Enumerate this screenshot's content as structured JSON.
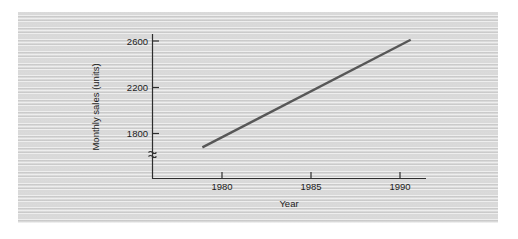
{
  "chart_data": {
    "type": "line",
    "title": "",
    "xlabel": "Year",
    "ylabel": "Monthly sales (units)",
    "xlim": [
      1976.8,
      1992.2
    ],
    "ylim": [
      1590,
      2690
    ],
    "grid": false,
    "legend": null,
    "y_axis_break": true,
    "y_axis_break_symbol": "≈",
    "xticks": [
      1980,
      1985,
      1990
    ],
    "xtick_labels": [
      "1980",
      "1985",
      "1990"
    ],
    "yticks": [
      1800,
      2200,
      2600
    ],
    "ytick_labels": [
      "1800",
      "2200",
      "2600"
    ],
    "series": [
      {
        "name": "Monthly sales",
        "color": "#575757",
        "x": [
          1978.9,
          1990.6
        ],
        "values": [
          1680,
          2610
        ]
      }
    ]
  },
  "figure": {
    "panel_color": "#d9d9d9",
    "axis_color": "#2e2e2e",
    "line_color": "#575757"
  }
}
